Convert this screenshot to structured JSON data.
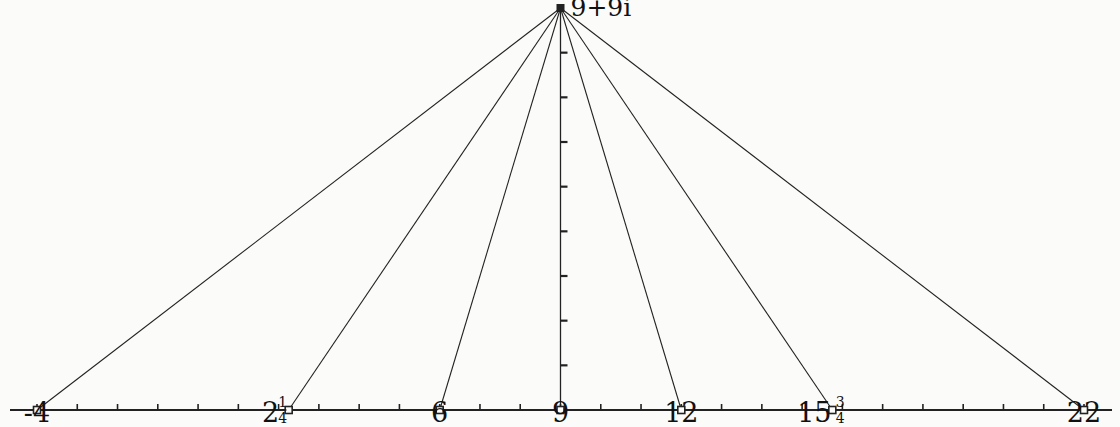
{
  "diagram": {
    "title": "",
    "apex": {
      "label": "9+9i",
      "re": 9,
      "im": 9
    },
    "axis": {
      "min": -4,
      "max": 22,
      "tick_step": 1
    },
    "vertical_axis": {
      "at": 9,
      "min": 0,
      "max": 9,
      "tick_step": 1
    },
    "points": [
      {
        "value": -4,
        "whole": "-4",
        "num": "",
        "den": ""
      },
      {
        "value": 2.25,
        "whole": "2",
        "num": "1",
        "den": "4"
      },
      {
        "value": 6,
        "whole": "6",
        "num": "",
        "den": ""
      },
      {
        "value": 9,
        "whole": "9",
        "num": "",
        "den": ""
      },
      {
        "value": 12,
        "whole": "12",
        "num": "",
        "den": ""
      },
      {
        "value": 15.75,
        "whole": "15",
        "num": "3",
        "den": "4"
      },
      {
        "value": 22,
        "whole": "22",
        "num": "",
        "den": ""
      }
    ],
    "colors": {
      "line": "#222222",
      "background": "#fbfbfa",
      "text": "#111111"
    }
  }
}
